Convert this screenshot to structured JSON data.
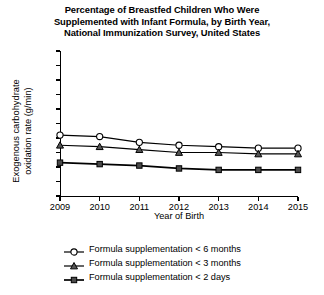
{
  "chart_data": {
    "type": "line",
    "title": "Percentage of Breastfed Children Who Were Supplemented with Infant Formula, by Birth Year, National Immunization Survey, United States",
    "title_lines": [
      "Percentage of Breastfed Children Who Were",
      "Supplemented with Infant Formula, by Birth Year,",
      "National Immunization Survey, United States"
    ],
    "xlabel": "Year of Birth",
    "ylabel": "Exogenous carbohydrate oxidation rate (g/min)",
    "ylabel_lines": [
      "Exogenous carbohydrate",
      "oxidation rate (g/min)"
    ],
    "categories": [
      "2009",
      "2010",
      "2011",
      "2012",
      "2013",
      "2014",
      "2015"
    ],
    "x": [
      2009,
      2010,
      2011,
      2012,
      2013,
      2014,
      2015
    ],
    "ylim": [
      0,
      100
    ],
    "yticks": [
      0,
      10,
      20,
      30,
      40,
      50,
      60,
      70,
      80,
      90,
      100
    ],
    "ytick_labels": [
      "0",
      "10",
      "20",
      "30",
      "40",
      "50",
      "60",
      "70",
      "80",
      "90",
      "100"
    ],
    "grid": false,
    "legend_position": "below",
    "series": [
      {
        "name": "Formula supplementation < 6 months",
        "marker": "open-circle",
        "color": "#000000",
        "values": [
          42,
          41,
          37,
          35,
          34,
          33,
          33
        ]
      },
      {
        "name": "Formula supplementation < 3 months",
        "marker": "filled-triangle",
        "color": "#000000",
        "values": [
          35,
          34,
          32,
          30,
          30,
          29,
          29
        ]
      },
      {
        "name": "Formula supplementation < 2 days",
        "marker": "filled-square",
        "color": "#000000",
        "values": [
          23,
          22,
          21,
          19,
          18,
          18,
          18
        ]
      }
    ]
  },
  "legend": [
    {
      "label": "Formula supplementation < 6 months",
      "marker": "open-circle"
    },
    {
      "label": "Formula supplementation < 3 months",
      "marker": "filled-triangle"
    },
    {
      "label": "Formula supplementation < 2 days",
      "marker": "filled-square"
    }
  ]
}
